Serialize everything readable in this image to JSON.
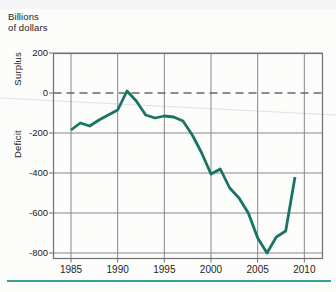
{
  "figure": {
    "units_label": {
      "line1": "Billions",
      "line2": "of dollars"
    },
    "y_axis_words": {
      "top": "Surplus",
      "bottom": "Deficit"
    }
  },
  "chart_data": {
    "type": "line",
    "title": "",
    "xlabel": "",
    "ylabel": "Billions of dollars",
    "x": [
      1985,
      1986,
      1987,
      1988,
      1989,
      1990,
      1991,
      1992,
      1993,
      1994,
      1995,
      1996,
      1997,
      1998,
      1999,
      2000,
      2001,
      2002,
      2003,
      2004,
      2005,
      2006,
      2007,
      2008,
      2009
    ],
    "values": [
      -185,
      -150,
      -165,
      -135,
      -110,
      -85,
      10,
      -40,
      -110,
      -125,
      -115,
      -120,
      -140,
      -210,
      -300,
      -405,
      -380,
      -475,
      -525,
      -600,
      -725,
      -800,
      -720,
      -690,
      -420
    ],
    "x_ticks": [
      1985,
      1990,
      1995,
      2000,
      2005,
      2010
    ],
    "x_tick_labels": [
      "1985",
      "1990",
      "1995",
      "2000",
      "2005",
      "2010"
    ],
    "y_ticks": [
      200,
      0,
      -200,
      -400,
      -600,
      -800
    ],
    "y_tick_labels": [
      "200",
      "0",
      "-200",
      "-400",
      "-600",
      "-800"
    ],
    "xlim": [
      1983,
      2012
    ],
    "ylim": [
      -830,
      200
    ],
    "grid": true,
    "legend_position": "none",
    "zero_line": "dashed",
    "annotations": {
      "y_axis_top": "Surplus",
      "y_axis_bottom": "Deficit"
    },
    "colors": {
      "line": "#1a7466",
      "grid": "#85898b",
      "border": "#6d7173",
      "zero_line": "#636869",
      "divider": "#38a090",
      "text": "#1c1c1c",
      "artifact": "#ccd2d4"
    }
  }
}
